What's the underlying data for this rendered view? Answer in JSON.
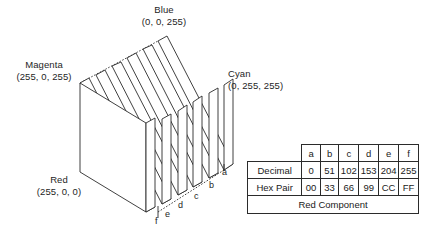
{
  "figure": {
    "vertex_labels": [
      {
        "name": "Blue",
        "triple": "(0, 0, 255)"
      },
      {
        "name": "Magenta",
        "triple": "(255, 0, 255)"
      },
      {
        "name": "Cyan",
        "triple": "(0, 255, 255)"
      },
      {
        "name": "Red",
        "triple": "(255, 0, 0)"
      }
    ],
    "slice_letters": [
      "a",
      "b",
      "c",
      "d",
      "e",
      "f"
    ],
    "line_color": "#2b2b2b",
    "fill_color": "#ffffff",
    "background": "#ffffff"
  },
  "table": {
    "corner_label": "",
    "columns": [
      "a",
      "b",
      "c",
      "d",
      "e",
      "f"
    ],
    "rows": [
      {
        "label": "Decimal",
        "values": [
          "0",
          "51",
          "102",
          "153",
          "204",
          "255"
        ]
      },
      {
        "label": "Hex Pair",
        "values": [
          "00",
          "33",
          "66",
          "99",
          "CC",
          "FF"
        ]
      }
    ],
    "footer": "Red Component"
  }
}
